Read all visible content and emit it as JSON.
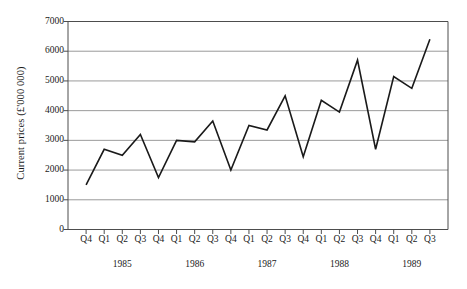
{
  "chart_data": {
    "type": "line",
    "title": "",
    "xlabel": "",
    "ylabel": "Current prices (£'000 000)",
    "ylim": [
      0,
      7000
    ],
    "ytick_labels": [
      "7000",
      "6000",
      "5000",
      "4000",
      "3000",
      "2000",
      "1000",
      "0"
    ],
    "yticks": [
      7000,
      6000,
      5000,
      4000,
      3000,
      2000,
      1000,
      0
    ],
    "grid": true,
    "grid_axis": "y",
    "legend": false,
    "legend_position": "none",
    "line_color": "#1a1a1a",
    "grid_color": "#9a9a9a",
    "axis_color": "#4d4d4d",
    "categories": [
      "Q4",
      "Q1",
      "Q2",
      "Q3",
      "Q4",
      "Q1",
      "Q2",
      "Q3",
      "Q4",
      "Q1",
      "Q2",
      "Q3",
      "Q4",
      "Q1",
      "Q2",
      "Q3",
      "Q4",
      "Q1",
      "Q2",
      "Q3"
    ],
    "values": [
      1500,
      2700,
      2500,
      3200,
      1750,
      3000,
      2950,
      3650,
      2000,
      3500,
      3350,
      4500,
      2450,
      4350,
      3950,
      5700,
      2700,
      5150,
      4750,
      6400
    ],
    "year_groups": [
      {
        "label": "1985",
        "center_index": 2
      },
      {
        "label": "1986",
        "center_index": 6
      },
      {
        "label": "1987",
        "center_index": 10
      },
      {
        "label": "1988",
        "center_index": 14
      },
      {
        "label": "1989",
        "center_index": 18
      }
    ]
  }
}
